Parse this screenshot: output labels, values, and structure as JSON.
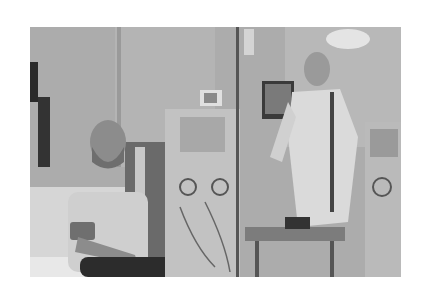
{
  "image": {
    "description": "Grayscale photograph of a dialysis room: a bearded seated patient in a t-shirt on a bed on the left, dialysis machines with IV pole in the center, and a clinician in a gown with back turned using a monitor on the right.",
    "palette": {
      "background": "#ffffff",
      "wall": "#acacac",
      "wall_light": "#c4c4c4",
      "machine": "#bdbdbd",
      "dark": "#2e2e2e",
      "gown": "#d8d8d8",
      "skin": "#8e8e8e"
    },
    "subjects": [
      "seated-patient",
      "dialysis-machine",
      "iv-pole",
      "clinician",
      "monitor",
      "side-table",
      "second-dialysis-machine"
    ]
  }
}
